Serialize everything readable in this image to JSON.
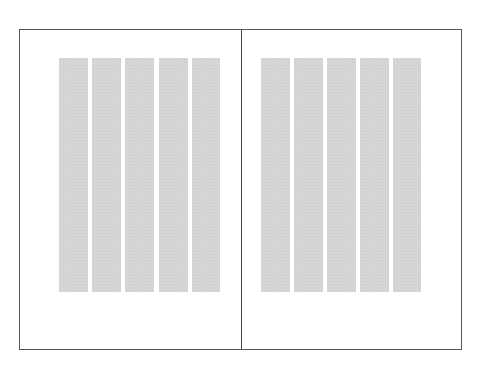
{
  "diagram": {
    "type": "two-page spread column grid",
    "pages": [
      {
        "name": "left-page",
        "columns": 5,
        "column_color": "#d6d6d6"
      },
      {
        "name": "right-page",
        "columns": 5,
        "column_color": "#d6d6d6"
      }
    ],
    "colors": {
      "frame": "#555555",
      "spine": "#444444",
      "column": "#d6d6d6",
      "background": "#ffffff"
    }
  }
}
